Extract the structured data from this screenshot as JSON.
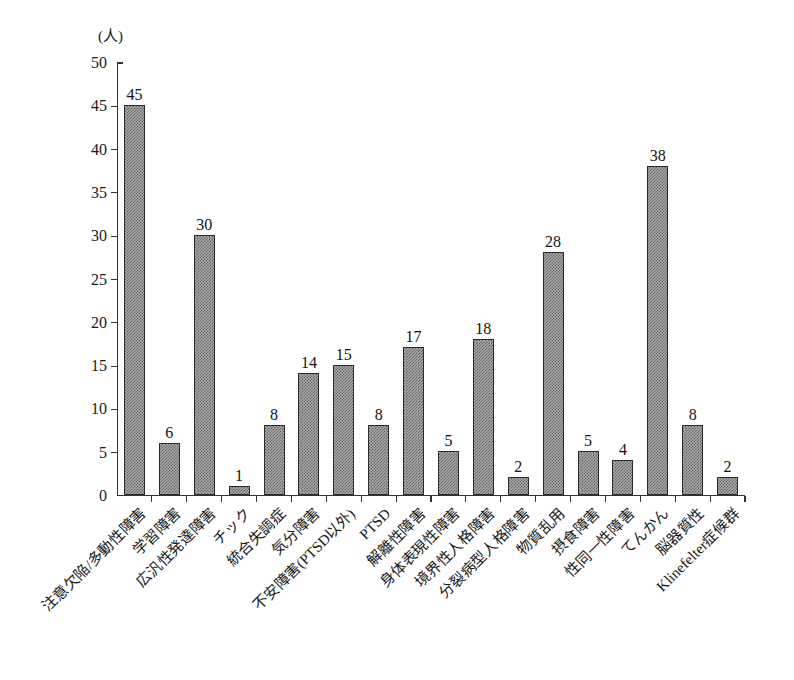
{
  "chart_data": {
    "type": "bar",
    "title": "",
    "xlabel": "",
    "ylabel": "(人)",
    "ylim": [
      0,
      50
    ],
    "ytick_step": 5,
    "yticks": [
      0,
      5,
      10,
      15,
      20,
      25,
      30,
      35,
      40,
      45,
      50
    ],
    "grid": false,
    "legend": null,
    "categories": [
      "注意欠陥/多動性障害",
      "学習障害",
      "広汎性発達障害",
      "チック",
      "統合失調症",
      "気分障害",
      "不安障害(PTSD以外)",
      "PTSD",
      "解離性障害",
      "身体表現性障害",
      "境界性人格障害",
      "分裂病型人格障害",
      "物質乱用",
      "摂食障害",
      "性同一性障害",
      "てんかん",
      "脳器質性",
      "Klinefelter症候群"
    ],
    "values": [
      45,
      6,
      30,
      1,
      8,
      14,
      15,
      8,
      17,
      5,
      18,
      2,
      28,
      5,
      4,
      38,
      8,
      2
    ],
    "value_labels": [
      "45",
      "6",
      "30",
      "1",
      "8",
      "14",
      "15",
      "8",
      "17",
      "5",
      "18",
      "2",
      "28",
      "5",
      "4",
      "38",
      "8",
      "2"
    ],
    "ytick_labels": [
      "0",
      "5",
      "10",
      "15",
      "20",
      "25",
      "30",
      "35",
      "40",
      "45",
      "50"
    ],
    "bar_color": "#a8a8a8",
    "bar_edge_color": "#2b2b2b",
    "axis_color": "#333333"
  }
}
